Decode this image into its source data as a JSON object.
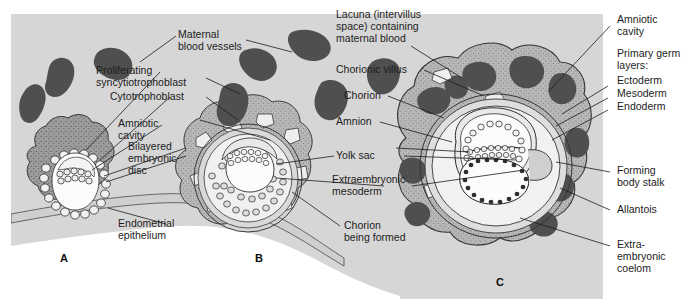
{
  "figure": {
    "background_color": "#ffffff",
    "panel_color": "#d6d6d6",
    "colors": {
      "panel_gray": "#d6d6d6",
      "blood_vessel_dark": "#4f4f4f",
      "syncytiotrophoblast": "#8e8e8e",
      "trophoblast_stipple": "#b8b8b8",
      "endometrium_light": "#c9c9c9",
      "cavity_white": "#fafafa",
      "outline": "#2b2b2b",
      "text": "#1c1c1c"
    }
  },
  "labels": {
    "maternal_blood_vessels": "Maternal\nblood vessels",
    "proliferating_syncytiotrophoblast": "Proliferating\nsyncytiotrophoblast",
    "cytotrophoblast": "Cytotrophoblast",
    "amniotic_cavity_a": "Amniotic\ncavity",
    "bilayered_embryonic_disc": "Bilayered\nembryonic\ndisc",
    "endometrial_epithelium": "Endometrial\nepithelium",
    "lacuna": "Lacuna (intervillus\nspace) containing\nmaternal blood",
    "chorionic_villus": "Chorionic villus",
    "chorion": "Chorion",
    "amnion": "Amnion",
    "yolk_sac": "Yolk sac",
    "extraembryonic_mesoderm": "Extraembryonic\nmesoderm",
    "chorion_being_formed": "Chorion\nbeing formed",
    "amniotic_cavity_c": "Amniotic\ncavity",
    "primary_germ_layers": "Primary germ\nlayers:",
    "ectoderm": "Ectoderm",
    "mesoderm": "Mesoderm",
    "endoderm": "Endoderm",
    "forming_body_stalk": "Forming\nbody stalk",
    "allantois": "Allantois",
    "extraembryonic_coelom": "Extra-\nembryonic\ncoelom"
  },
  "panels": {
    "a": "A",
    "b": "B",
    "c": "C"
  }
}
